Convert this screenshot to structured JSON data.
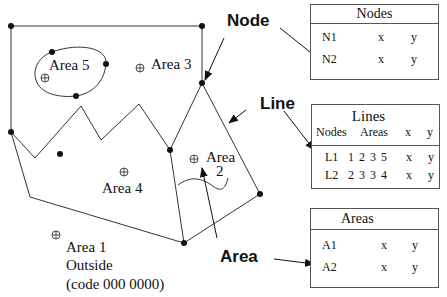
{
  "labels": {
    "node": "Node",
    "line": "Line",
    "area": "Area"
  },
  "areas": {
    "area5": "Area 5",
    "area3": "Area 3",
    "area4": "Area 4",
    "area2_line1": "Area",
    "area2_line2": "2",
    "area1_line1": "Area 1",
    "area1_line2": "Outside",
    "area1_line3": "(code 000 0000)"
  },
  "tables": {
    "nodes": {
      "title": "Nodes",
      "rows": [
        {
          "id": "N1",
          "x": "x",
          "y": "y"
        },
        {
          "id": "N2",
          "x": "x",
          "y": "y"
        }
      ]
    },
    "lines": {
      "title": "Lines",
      "headers": {
        "nodes": "Nodes",
        "areas": "Areas",
        "x": "x",
        "y": "y"
      },
      "rows": [
        {
          "id": "L1",
          "values": "1 2 3 5",
          "x": "x",
          "y": "y"
        },
        {
          "id": "L2",
          "values": "2 3 3 4",
          "x": "x",
          "y": "y"
        }
      ]
    },
    "areas": {
      "title": "Areas",
      "rows": [
        {
          "id": "A1",
          "x": "x",
          "y": "y"
        },
        {
          "id": "A2",
          "x": "x",
          "y": "y"
        }
      ]
    }
  }
}
